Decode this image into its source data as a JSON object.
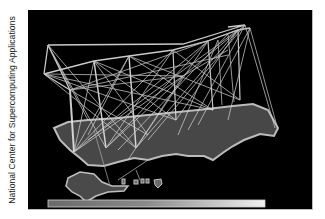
{
  "figure": {
    "credit_text": "National Center for Supercomputing Applications",
    "colors": {
      "background": "#000000",
      "land": "#4a4a4a",
      "land_edge": "#b8b8b8",
      "arcs": "#d8d8d8",
      "page": "#ffffff"
    },
    "legend_bar": {
      "gradient_from": "#6a6a6a",
      "gradient_to": "#f0f0f0"
    }
  }
}
